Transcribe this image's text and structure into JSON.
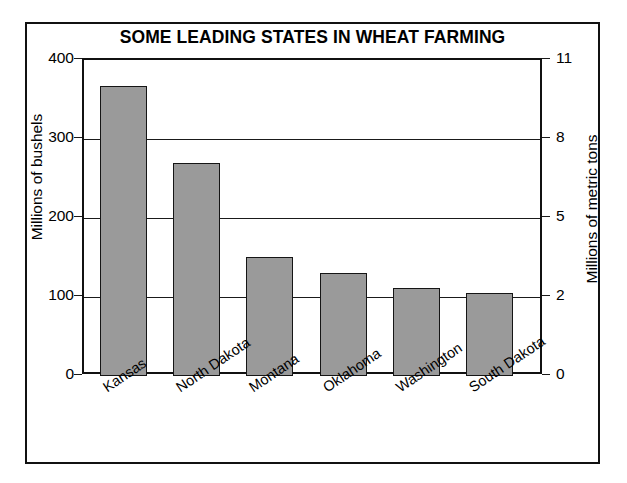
{
  "chart_data": {
    "type": "bar",
    "title": "SOME LEADING STATES IN WHEAT FARMING",
    "categories": [
      "Kansas",
      "North Dakota",
      "Montana",
      "Oklahoma",
      "Washington",
      "South Dakota"
    ],
    "values": [
      367,
      270,
      151,
      131,
      112,
      105
    ],
    "xlabel": "",
    "ylabel": "Millions of bushels",
    "ylim": [
      0,
      400
    ],
    "yticks": [
      0,
      100,
      200,
      300,
      400
    ],
    "ytick_labels": [
      "0",
      "100",
      "200",
      "300",
      "400"
    ],
    "secondary_axis": {
      "ylabel": "Millions of metric tons",
      "ylim": [
        0,
        11
      ],
      "yticks": [
        0,
        2,
        5,
        8,
        11
      ],
      "ytick_labels": [
        "0",
        "2",
        "5",
        "8",
        "11"
      ]
    },
    "grid": true,
    "legend": "none",
    "bar_color": "#9a9a9a",
    "bar_edge_color": "#151515",
    "background_color": "#ffffff",
    "frame_color": "#111111"
  },
  "axes": {
    "left_label": "Millions of bushels",
    "right_label": "Millions of metric tons",
    "left_ticks": [
      {
        "label": "400",
        "value": 400
      },
      {
        "label": "300",
        "value": 300
      },
      {
        "label": "200",
        "value": 200
      },
      {
        "label": "100",
        "value": 100
      },
      {
        "label": "0",
        "value": 0
      }
    ],
    "right_ticks": [
      {
        "label": "11",
        "value": 11
      },
      {
        "label": "8",
        "value": 8
      },
      {
        "label": "5",
        "value": 5
      },
      {
        "label": "2",
        "value": 2
      },
      {
        "label": "0",
        "value": 0
      }
    ]
  },
  "bars": [
    {
      "label": "Kansas",
      "value": 367
    },
    {
      "label": "North Dakota",
      "value": 270
    },
    {
      "label": "Montana",
      "value": 151
    },
    {
      "label": "Oklahoma",
      "value": 131
    },
    {
      "label": "Washington",
      "value": 112
    },
    {
      "label": "South Dakota",
      "value": 105
    }
  ]
}
